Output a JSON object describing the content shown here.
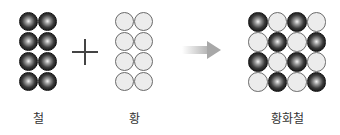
{
  "diagram": {
    "reactants": [
      {
        "label": "철",
        "element": "iron",
        "rows": 4,
        "cols": 2,
        "color": "#1a1a1a",
        "pattern": [
          [
            "iron",
            "iron"
          ],
          [
            "iron",
            "iron"
          ],
          [
            "iron",
            "iron"
          ],
          [
            "iron",
            "iron"
          ]
        ]
      },
      {
        "label": "황",
        "element": "sulfur",
        "rows": 4,
        "cols": 2,
        "color": "#ececec",
        "pattern": [
          [
            "sulfur",
            "sulfur"
          ],
          [
            "sulfur",
            "sulfur"
          ],
          [
            "sulfur",
            "sulfur"
          ],
          [
            "sulfur",
            "sulfur"
          ]
        ]
      }
    ],
    "operator_icon": "plus-icon",
    "arrow_icon": "arrow-right-icon",
    "product": {
      "label": "황화철",
      "rows": 4,
      "cols": 4,
      "pattern": [
        [
          "iron",
          "sulfur",
          "iron",
          "sulfur"
        ],
        [
          "sulfur",
          "iron",
          "sulfur",
          "iron"
        ],
        [
          "iron",
          "sulfur",
          "iron",
          "sulfur"
        ],
        [
          "sulfur",
          "iron",
          "sulfur",
          "iron"
        ]
      ]
    }
  }
}
